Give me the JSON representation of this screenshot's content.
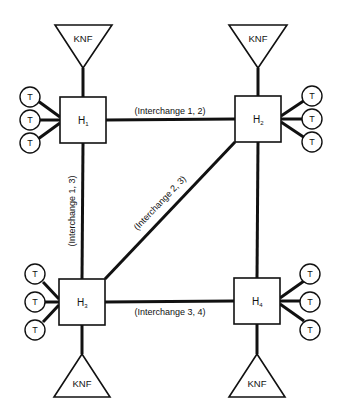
{
  "colors": {
    "line": "#111111",
    "background": "#ffffff"
  },
  "hubs": [
    {
      "id": "H1",
      "label": "H",
      "sub": "1",
      "x": 60,
      "y": 97,
      "cx": 83,
      "cy": 120
    },
    {
      "id": "H2",
      "label": "H",
      "sub": "2",
      "x": 235,
      "y": 96,
      "cx": 258,
      "cy": 119
    },
    {
      "id": "H3",
      "label": "H",
      "sub": "3",
      "x": 59,
      "y": 279,
      "cx": 82,
      "cy": 302
    },
    {
      "id": "H4",
      "label": "H",
      "sub": "4",
      "x": 234,
      "y": 278,
      "cx": 257,
      "cy": 301
    }
  ],
  "knf": [
    {
      "hub": "H1",
      "label": "KNF"
    },
    {
      "hub": "H2",
      "label": "KNF"
    },
    {
      "hub": "H3",
      "label": "KNF"
    },
    {
      "hub": "H4",
      "label": "KNF"
    }
  ],
  "terminals": {
    "label": "T",
    "H1": [
      "T",
      "T",
      "T"
    ],
    "H2": [
      "T",
      "T",
      "T"
    ],
    "H3": [
      "T",
      "T",
      "T"
    ],
    "H4": [
      "T",
      "T",
      "T"
    ]
  },
  "interchanges": [
    {
      "id": "1-2",
      "label": "(Interchange 1, 2)"
    },
    {
      "id": "1-3",
      "label": "(Interchange 1, 3)"
    },
    {
      "id": "2-3",
      "label": "(Interchange 2, 3)"
    },
    {
      "id": "3-4",
      "label": "(Interchange 3, 4)"
    }
  ]
}
